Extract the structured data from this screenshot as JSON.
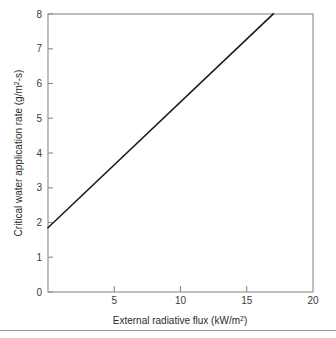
{
  "chart_data": {
    "type": "line",
    "title": "",
    "xlabel": "External radiative flux (kW/m²)",
    "ylabel": "Critical water application rate (g/m²-s)",
    "xlabel_base": "External radiative flux (kW/m",
    "xlabel_sup": "2",
    "xlabel_tail": ")",
    "ylabel_base": "Critical water application rate (g/m",
    "ylabel_sup": "2",
    "ylabel_tail": "-s)",
    "xlim": [
      0,
      20
    ],
    "ylim": [
      0,
      8
    ],
    "grid": false,
    "legend": "none",
    "xticks": [
      0,
      5,
      10,
      15,
      20
    ],
    "xtick_labels": [
      "",
      "5",
      "10",
      "15",
      "20"
    ],
    "yticks": [
      0,
      1,
      2,
      3,
      4,
      5,
      6,
      7,
      8
    ],
    "ytick_labels": [
      "0",
      "1",
      "2",
      "3",
      "4",
      "5",
      "6",
      "7",
      "8"
    ],
    "series": [
      {
        "name": "critical water application rate",
        "x": [
          0,
          17
        ],
        "values": [
          1.85,
          8.0
        ],
        "color": "#1a1a1a",
        "slope": 0.362,
        "intercept": 1.85
      }
    ]
  },
  "figure": {
    "background": "#ffffff",
    "frame_color": "#8a8a8a",
    "divider_color": "#9d9d9d"
  }
}
